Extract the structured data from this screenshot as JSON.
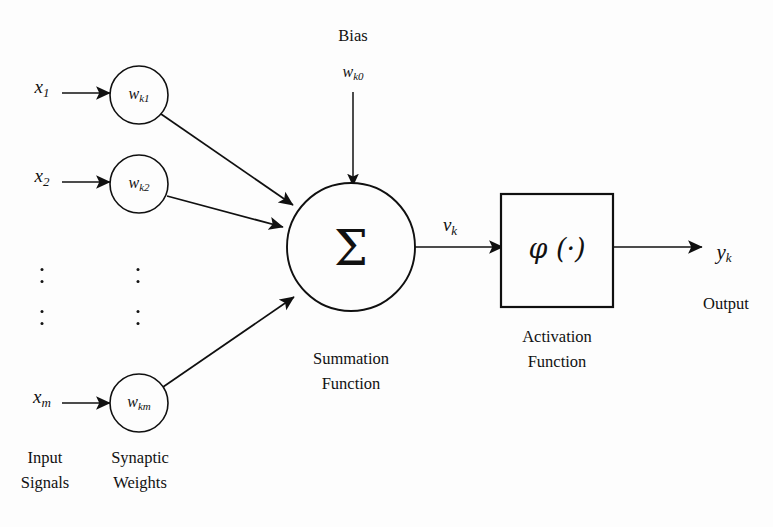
{
  "diagram": {
    "background_color": "#fdfdfd",
    "ink_color": "#111111"
  },
  "inputs": {
    "group_caption_line1": "Input",
    "group_caption_line2": "Signals",
    "items": [
      {
        "base": "x",
        "sub": "1"
      },
      {
        "base": "x",
        "sub": "2"
      },
      {
        "base": "x",
        "sub": "m"
      }
    ],
    "ellipsis_dots": 4
  },
  "weights": {
    "group_caption_line1": "Synaptic",
    "group_caption_line2": "Weights",
    "items": [
      {
        "base": "w",
        "sub": "k1"
      },
      {
        "base": "w",
        "sub": "k2"
      },
      {
        "base": "w",
        "sub": "km"
      }
    ],
    "ellipsis_dots": 4
  },
  "bias": {
    "label": "Bias",
    "symbol_base": "w",
    "symbol_sub": "k0"
  },
  "summation": {
    "symbol": "Σ",
    "caption_line1": "Summation",
    "caption_line2": "Function",
    "output_base": "v",
    "output_sub": "k"
  },
  "activation": {
    "symbol": "φ (·)",
    "caption_line1": "Activation",
    "caption_line2": "Function"
  },
  "output": {
    "base": "y",
    "sub": "k",
    "caption": "Output"
  }
}
